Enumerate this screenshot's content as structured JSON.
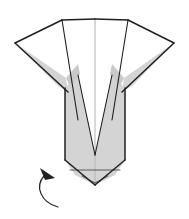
{
  "figure": {
    "title": "Origami fold step diagram",
    "kind": "line-drawing",
    "caption": "",
    "background_color": "#ffffff",
    "canvas": {
      "width": 189,
      "height": 219
    }
  },
  "palette": {
    "paper_front": "#ffffff",
    "paper_back": "#d4d4d4",
    "paper_back_shadow": "#c9c9c9",
    "outline": "#231f20",
    "soft_crease": "#b9b9b9",
    "arrow": "#231f20"
  },
  "shapes": {
    "left_wing_white": {
      "name": "left-wing-white-facet",
      "fill": "#ffffff",
      "points": "15,43 62,20 78,64 66,78 58,72"
    },
    "right_wing_white": {
      "name": "right-wing-white-facet",
      "fill": "#ffffff",
      "points": "174,43 128,20 112,64 124,78 132,72"
    },
    "left_wing_gray": {
      "name": "left-wing-gray-underside",
      "fill": "#d4d4d4",
      "points": "15,43 66,78 68,92 58,86"
    },
    "right_wing_gray": {
      "name": "right-wing-gray-underside",
      "fill": "#d4d4d4",
      "points": "174,43 124,78 122,92 132,86"
    },
    "center_white_left": {
      "name": "center-white-left-facet",
      "fill": "#ffffff",
      "points": "62,20 95,20 95,155 78,120"
    },
    "center_white_right": {
      "name": "center-white-right-facet",
      "fill": "#ffffff",
      "points": "128,20 95,20 95,155 112,120"
    },
    "body_gray_left": {
      "name": "body-gray-left-facet",
      "fill": "#d4d4d4",
      "points": "65,88 78,75 95,155 95,185 75,175 65,160"
    },
    "body_gray_right": {
      "name": "body-gray-right-facet",
      "fill": "#d4d4d4",
      "points": "125,88 112,75 95,155 95,185 115,175 125,160"
    },
    "notch_left": {
      "name": "left-notch-sliver",
      "fill": "#d4d4d4",
      "points": "66,78 78,64 80,74 70,86"
    },
    "notch_right": {
      "name": "right-notch-sliver",
      "fill": "#d4d4d4",
      "points": "124,78 112,64 110,74 120,86"
    }
  },
  "lines": {
    "top_edge_left": "62,20 95,19",
    "top_edge_right": "95,19 128,20",
    "center_crease": "95,20 95,183",
    "left_wing_upper": "15,43 62,20",
    "right_wing_upper": "174,43 128,20",
    "left_wing_lower": "15,43 68,92",
    "right_wing_lower": "174,43 122,92",
    "left_inner_diag": "62,20 78,120",
    "right_inner_diag": "128,20 112,120",
    "body_left_side": "65,88 65,160",
    "body_right_side": "125,88 125,160",
    "body_left_taper": "65,160 95,185",
    "body_right_taper": "125,160 95,185",
    "v_left": "78,75 95,155",
    "v_right": "112,75 95,155",
    "bottom_fold": "70,170 120,170",
    "bottom_v_left": "82,176 95,183",
    "bottom_v_right": "108,176 95,183"
  },
  "arrow": {
    "name": "fold-direction-arrow",
    "description": "curved arrow pointing up and to the right",
    "path": "M 58,207 C 40,202 35,186 44,176",
    "head_points": "40,168 55,178 45,180",
    "color": "#231f20"
  },
  "labels": {
    "step_number": "",
    "note": ""
  }
}
